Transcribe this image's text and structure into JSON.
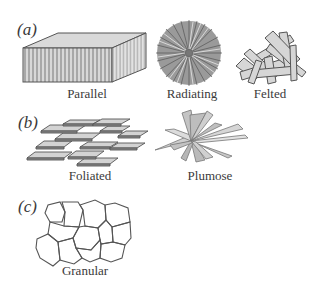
{
  "figure": {
    "panels": [
      {
        "label": "(a)",
        "items": [
          {
            "caption": "Parallel",
            "shape": "block-with-parallel-fibers"
          },
          {
            "caption": "Radiating",
            "shape": "radial-needle-sphere"
          },
          {
            "caption": "Felted",
            "shape": "random-jumbled-laths"
          }
        ]
      },
      {
        "label": "(b)",
        "items": [
          {
            "caption": "Foliated",
            "shape": "stacked-overlapping-plates"
          },
          {
            "caption": "Plumose",
            "shape": "feathery-radiating-blades"
          }
        ]
      },
      {
        "label": "(c)",
        "items": [
          {
            "caption": "Granular",
            "shape": "polygonal-grain-mosaic"
          }
        ]
      }
    ],
    "colors": {
      "stroke": "#555555",
      "fill_light": "#d9d9d9",
      "fill_mid": "#bdbdbd",
      "fill_dark": "#8a8a8a",
      "text": "#3a3a3a"
    }
  }
}
